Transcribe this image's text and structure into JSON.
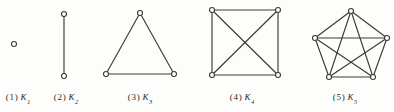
{
  "figure": {
    "background_color": "#fdfdfc",
    "stroke_color": "#3a3a38",
    "vertex_fill": "#ffffff",
    "vertex_stroke": "#3a3a38"
  },
  "panels": [
    {
      "index_label": "1",
      "graph_letter": "K",
      "graph_subscript": "1",
      "caption_x": 18,
      "caption_y": 93,
      "vertex_count": 1,
      "edge_count": 0,
      "vertices": [
        {
          "x": 14,
          "y": 44
        }
      ],
      "edges": []
    },
    {
      "index_label": "2",
      "graph_letter": "K",
      "graph_subscript": "2",
      "caption_x": 66,
      "caption_y": 93,
      "vertex_count": 2,
      "edge_count": 1,
      "vertices": [
        {
          "x": 64,
          "y": 14
        },
        {
          "x": 64,
          "y": 76
        }
      ],
      "edges": [
        [
          0,
          1
        ]
      ]
    },
    {
      "index_label": "3",
      "graph_letter": "K",
      "graph_subscript": "3",
      "caption_x": 140,
      "caption_y": 93,
      "vertex_count": 3,
      "edge_count": 3,
      "vertices": [
        {
          "x": 140,
          "y": 13
        },
        {
          "x": 106,
          "y": 74
        },
        {
          "x": 174,
          "y": 74
        }
      ],
      "edges": [
        [
          0,
          1
        ],
        [
          0,
          2
        ],
        [
          1,
          2
        ]
      ]
    },
    {
      "index_label": "4",
      "graph_letter": "K",
      "graph_subscript": "4",
      "caption_x": 242,
      "caption_y": 93,
      "vertex_count": 4,
      "edge_count": 6,
      "vertices": [
        {
          "x": 212,
          "y": 10
        },
        {
          "x": 278,
          "y": 10
        },
        {
          "x": 278,
          "y": 75
        },
        {
          "x": 212,
          "y": 75
        }
      ],
      "edges": [
        [
          0,
          1
        ],
        [
          1,
          2
        ],
        [
          2,
          3
        ],
        [
          3,
          0
        ],
        [
          0,
          2
        ],
        [
          1,
          3
        ]
      ]
    },
    {
      "index_label": "5",
      "graph_letter": "K",
      "graph_subscript": "5",
      "caption_x": 345,
      "caption_y": 93,
      "vertex_count": 5,
      "edge_count": 10,
      "vertices": [
        {
          "x": 351,
          "y": 11
        },
        {
          "x": 387,
          "y": 38
        },
        {
          "x": 373,
          "y": 77
        },
        {
          "x": 329,
          "y": 77
        },
        {
          "x": 315,
          "y": 38
        }
      ],
      "edges": [
        [
          0,
          1
        ],
        [
          1,
          2
        ],
        [
          2,
          3
        ],
        [
          3,
          4
        ],
        [
          4,
          0
        ],
        [
          0,
          2
        ],
        [
          0,
          3
        ],
        [
          1,
          3
        ],
        [
          1,
          4
        ],
        [
          2,
          4
        ]
      ]
    }
  ]
}
